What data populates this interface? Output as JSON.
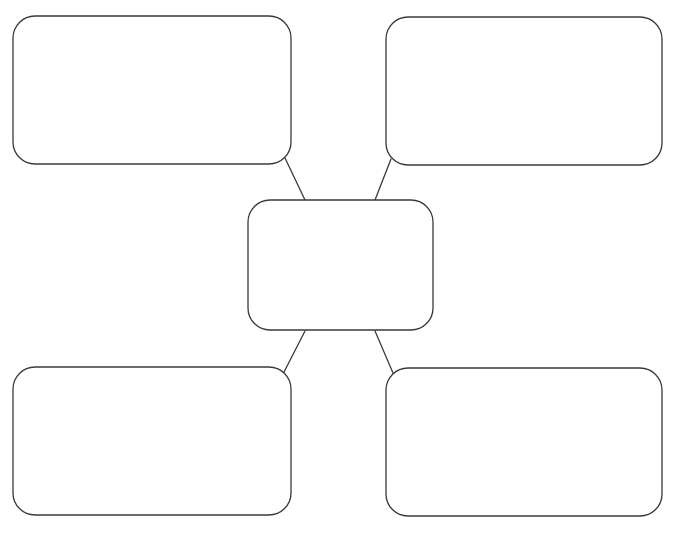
{
  "diagram": {
    "type": "mind-map-template",
    "background": "#ffffff",
    "stroke_color": "#3a3a3a",
    "stroke_width": 1.3,
    "corner_radius": 22,
    "nodes": [
      {
        "id": "center",
        "label": "",
        "x": 248,
        "y": 200,
        "w": 185,
        "h": 130
      },
      {
        "id": "top-left",
        "label": "",
        "x": 13,
        "y": 16,
        "w": 278,
        "h": 148
      },
      {
        "id": "top-right",
        "label": "",
        "x": 386,
        "y": 17,
        "w": 276,
        "h": 148
      },
      {
        "id": "bottom-left",
        "label": "",
        "x": 13,
        "y": 367,
        "w": 278,
        "h": 148
      },
      {
        "id": "bottom-right",
        "label": "",
        "x": 386,
        "y": 368,
        "w": 276,
        "h": 148
      }
    ],
    "edges": [
      {
        "from": "center",
        "to": "top-left",
        "x1": 305,
        "y1": 200,
        "x2": 285,
        "y2": 158
      },
      {
        "from": "center",
        "to": "top-right",
        "x1": 375,
        "y1": 200,
        "x2": 391,
        "y2": 159
      },
      {
        "from": "center",
        "to": "bottom-left",
        "x1": 305,
        "y1": 331,
        "x2": 283,
        "y2": 374
      },
      {
        "from": "center",
        "to": "bottom-right",
        "x1": 375,
        "y1": 331,
        "x2": 393,
        "y2": 373
      }
    ]
  }
}
